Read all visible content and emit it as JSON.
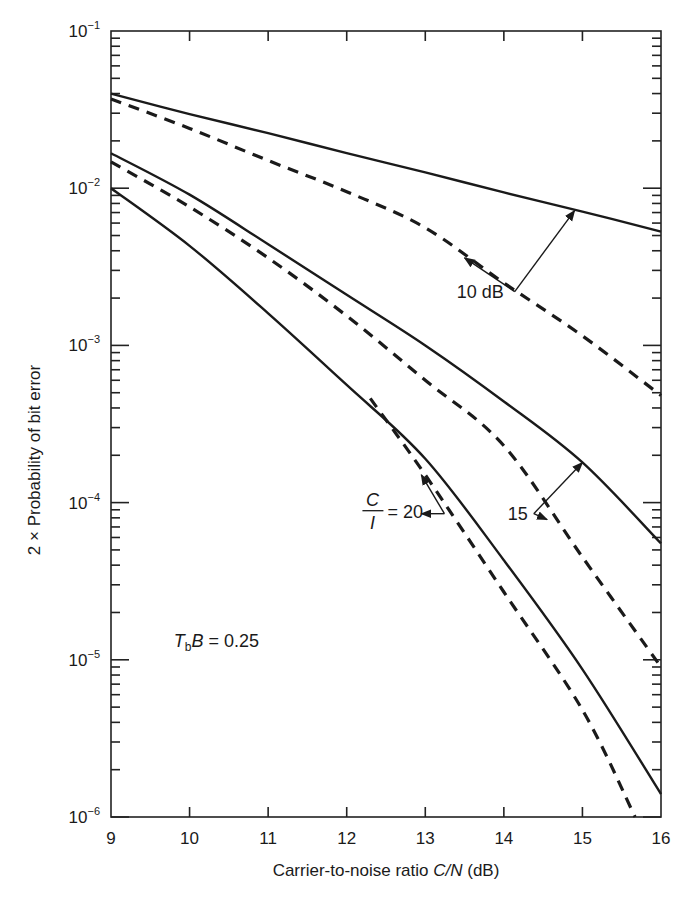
{
  "chart_data": {
    "type": "line",
    "title": "",
    "xlabel": "Carrier-to-noise ratio C/N (dB)",
    "xlabel_parts": {
      "prefix": "Carrier-to-noise ratio ",
      "var": "C/N",
      "suffix": " (dB)"
    },
    "ylabel": "2 × Probability of bit error",
    "yscale": "log",
    "xlim": [
      9,
      16
    ],
    "ylim": [
      1e-06,
      0.1
    ],
    "grid": false,
    "xticks": [
      9,
      10,
      11,
      12,
      13,
      14,
      15,
      16
    ],
    "xtick_labels": [
      "9",
      "10",
      "11",
      "12",
      "13",
      "14",
      "15",
      "16"
    ],
    "yticks": [
      0.1,
      0.01,
      0.001,
      0.0001,
      1e-05,
      1e-06
    ],
    "ytick_labels": [
      {
        "base": "10",
        "exp": "−1"
      },
      {
        "base": "10",
        "exp": "−2"
      },
      {
        "base": "10",
        "exp": "−3"
      },
      {
        "base": "10",
        "exp": "−4"
      },
      {
        "base": "10",
        "exp": "−5"
      },
      {
        "base": "10",
        "exp": "−6"
      }
    ],
    "series": [
      {
        "name": "C/I = 10 dB (solid)",
        "style": "solid",
        "x": [
          9,
          10,
          11,
          12,
          13,
          14,
          15,
          16
        ],
        "values": [
          0.04,
          0.0296,
          0.0224,
          0.0167,
          0.0126,
          0.0094,
          0.0071,
          0.0053
        ]
      },
      {
        "name": "C/I = 10 dB (dashed)",
        "style": "dashed",
        "x": [
          9,
          10,
          11,
          12,
          13,
          14,
          15,
          16
        ],
        "values": [
          0.037,
          0.024,
          0.015,
          0.0095,
          0.0056,
          0.0025,
          0.00115,
          0.00048
        ]
      },
      {
        "name": "C/I = 15 dB (solid)",
        "style": "solid",
        "x": [
          9,
          10,
          11,
          12,
          13,
          14,
          15,
          16
        ],
        "values": [
          0.0167,
          0.0091,
          0.0044,
          0.0021,
          0.001,
          0.00044,
          0.00018,
          5.5e-05
        ]
      },
      {
        "name": "C/I = 15 dB (dashed)",
        "style": "dashed",
        "x": [
          9,
          10,
          11,
          12,
          13,
          14,
          15,
          16
        ],
        "values": [
          0.0147,
          0.0076,
          0.0036,
          0.00154,
          0.0006,
          0.00023,
          4.5e-05,
          9e-06
        ]
      },
      {
        "name": "C/I = 20 dB (solid)",
        "style": "solid",
        "x": [
          9,
          10,
          11,
          12,
          13,
          14,
          15,
          16
        ],
        "values": [
          0.01,
          0.0043,
          0.0016,
          0.00056,
          0.00019,
          4.3e-05,
          8.7e-06,
          1.4e-06
        ]
      },
      {
        "name": "C/I = 20 dB (dashed)",
        "style": "dashed",
        "x": [
          12.3,
          13,
          14,
          15,
          15.67
        ],
        "values": [
          0.00046,
          0.00015,
          2.7e-05,
          4.8e-06,
          1e-06
        ]
      }
    ],
    "annotations": [
      {
        "text": "10 dB",
        "x": 13.4,
        "y": 0.0022,
        "arrows_to": [
          [
            14.9,
            0.0072
          ],
          [
            13.5,
            0.0036
          ]
        ]
      },
      {
        "text": "15",
        "x": 14.05,
        "y": 8.5e-05,
        "arrows_to": [
          [
            15.0,
            0.00018
          ],
          [
            14.55,
            7.8e-05
          ]
        ]
      },
      {
        "text": "= 20",
        "x": 12.2,
        "y": 8.5e-05,
        "frac_num": "C",
        "frac_den": "I",
        "arrows_to": [
          [
            12.95,
            0.00015
          ],
          [
            12.95,
            8.5e-05
          ]
        ]
      },
      {
        "text": "B = 0.25",
        "T_sub": "b",
        "x": 9.8,
        "y": 1.2e-05
      }
    ]
  }
}
